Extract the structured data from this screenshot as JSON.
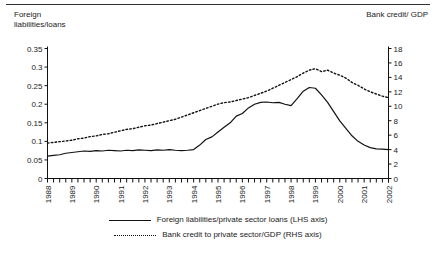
{
  "figure": {
    "lhs_axis_title": "Foreign\nliabilities/loans",
    "rhs_axis_title": "Bank credit/ GDP",
    "line_color": "#111111"
  },
  "legend": {
    "items": [
      {
        "label": "Foreign liabilities/private sector loans (LHS axis)",
        "style": "solid"
      },
      {
        "label": "Bank credit to private sector/GDP (RHS axis)",
        "style": "dotted"
      }
    ]
  },
  "chart_data": {
    "type": "line",
    "title": "",
    "xlabel": "",
    "ylabel": "Foreign liabilities/loans",
    "y2label": "Bank credit/ GDP",
    "grid": false,
    "legend_position": "bottom",
    "x_tick_labels": [
      "1988",
      "1989",
      "1990",
      "1991",
      "1992",
      "1993",
      "1994",
      "1995",
      "1996",
      "1997",
      "1998",
      "1999",
      "2000",
      "2001",
      "2002"
    ],
    "x_tick_rotation": 90,
    "x_minor_ticks_per_year": 4,
    "xlim": [
      1988,
      2002
    ],
    "ylim": [
      0,
      0.35
    ],
    "y_ticks": [
      0,
      0.05,
      0.1,
      0.15,
      0.2,
      0.25,
      0.3,
      0.35
    ],
    "y_tick_labels": [
      "0",
      "0.05",
      "0.1",
      "0.15",
      "0.2",
      "0.25",
      "0.3",
      "0.35"
    ],
    "y2lim": [
      0,
      18
    ],
    "y2_ticks": [
      0,
      2,
      4,
      6,
      8,
      10,
      12,
      14,
      16,
      18
    ],
    "y2_tick_labels": [
      "0",
      "2",
      "4",
      "6",
      "8",
      "10",
      "12",
      "14",
      "16",
      "18"
    ],
    "x": [
      1988.0,
      1988.25,
      1988.5,
      1988.75,
      1989.0,
      1989.25,
      1989.5,
      1989.75,
      1990.0,
      1990.25,
      1990.5,
      1990.75,
      1991.0,
      1991.25,
      1991.5,
      1991.75,
      1992.0,
      1992.25,
      1992.5,
      1992.75,
      1993.0,
      1993.25,
      1993.5,
      1993.75,
      1994.0,
      1994.25,
      1994.5,
      1994.75,
      1995.0,
      1995.25,
      1995.5,
      1995.75,
      1996.0,
      1996.25,
      1996.5,
      1996.75,
      1997.0,
      1997.25,
      1997.5,
      1997.75,
      1998.0,
      1998.25,
      1998.5,
      1998.75,
      1999.0,
      1999.25,
      1999.5,
      1999.75,
      2000.0,
      2000.25,
      2000.5,
      2000.75,
      2001.0,
      2001.25,
      2001.5,
      2001.75,
      2002.0
    ],
    "series": [
      {
        "name": "Foreign liabilities/private sector loans (LHS axis)",
        "axis": "left",
        "style": "solid",
        "values": [
          0.06,
          0.062,
          0.064,
          0.068,
          0.07,
          0.072,
          0.074,
          0.073,
          0.075,
          0.074,
          0.076,
          0.075,
          0.074,
          0.076,
          0.075,
          0.077,
          0.076,
          0.075,
          0.077,
          0.076,
          0.078,
          0.076,
          0.075,
          0.076,
          0.078,
          0.09,
          0.105,
          0.112,
          0.125,
          0.138,
          0.15,
          0.168,
          0.175,
          0.19,
          0.2,
          0.205,
          0.206,
          0.204,
          0.205,
          0.2,
          0.196,
          0.215,
          0.235,
          0.245,
          0.243,
          0.225,
          0.205,
          0.18,
          0.155,
          0.135,
          0.115,
          0.1,
          0.09,
          0.083,
          0.08,
          0.079,
          0.078
        ]
      },
      {
        "name": "Bank credit to private sector/GDP (RHS axis)",
        "axis": "right",
        "style": "dotted",
        "values": [
          4.9,
          5.0,
          5.1,
          5.2,
          5.3,
          5.5,
          5.6,
          5.8,
          5.9,
          6.1,
          6.2,
          6.4,
          6.6,
          6.8,
          6.9,
          7.1,
          7.3,
          7.4,
          7.6,
          7.8,
          8.0,
          8.2,
          8.5,
          8.8,
          9.1,
          9.4,
          9.7,
          10.0,
          10.3,
          10.5,
          10.6,
          10.8,
          11.0,
          11.2,
          11.5,
          11.8,
          12.1,
          12.5,
          12.9,
          13.3,
          13.7,
          14.1,
          14.6,
          15.0,
          15.2,
          14.8,
          15.0,
          14.6,
          14.3,
          13.9,
          13.3,
          12.9,
          12.4,
          12.0,
          11.7,
          11.4,
          11.2
        ]
      }
    ]
  }
}
